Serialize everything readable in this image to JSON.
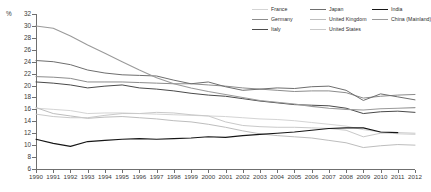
{
  "chart_data": {
    "type": "line",
    "title": "",
    "xlabel": "",
    "ylabel": "%",
    "unit_label": "%",
    "xlim": [
      1990,
      2012
    ],
    "ylim": [
      6,
      32
    ],
    "ytick_step": 2,
    "grid": false,
    "legend_position": "top-right",
    "x": [
      1990,
      1991,
      1992,
      1993,
      1994,
      1995,
      1996,
      1997,
      1998,
      1999,
      2000,
      2001,
      2002,
      2003,
      2004,
      2005,
      2006,
      2007,
      2008,
      2009,
      2010,
      2011,
      2012
    ],
    "yticks": [
      6,
      8,
      10,
      12,
      14,
      16,
      18,
      20,
      22,
      24,
      26,
      28,
      30,
      32
    ],
    "xticks": [
      1990,
      1991,
      1992,
      1993,
      1994,
      1995,
      1996,
      1997,
      1998,
      1999,
      2000,
      2001,
      2002,
      2003,
      2004,
      2005,
      2006,
      2007,
      2008,
      2009,
      2010,
      2011,
      2012
    ],
    "series": [
      {
        "name": "France",
        "color": "#d4d4d4",
        "width": 1.0,
        "values": [
          16.2,
          16.0,
          15.8,
          15.3,
          15.4,
          15.4,
          15.3,
          15.2,
          15.1,
          15.0,
          14.9,
          14.8,
          14.6,
          14.4,
          14.3,
          14.1,
          13.8,
          13.5,
          13.2,
          12.6,
          12.2,
          11.9,
          11.8
        ]
      },
      {
        "name": "Germany",
        "color": "#8c8c8c",
        "width": 1.0,
        "values": [
          21.5,
          21.4,
          21.2,
          20.6,
          20.6,
          20.6,
          20.5,
          20.4,
          20.3,
          20.3,
          20.1,
          19.9,
          19.6,
          19.4,
          19.2,
          19.0,
          19.1,
          19.1,
          18.8,
          17.9,
          18.2,
          18.4,
          18.5
        ]
      },
      {
        "name": "Italy",
        "color": "#4a4a4a",
        "width": 1.0,
        "values": [
          20.6,
          20.4,
          20.1,
          19.6,
          19.9,
          20.1,
          19.6,
          19.4,
          19.1,
          18.7,
          18.4,
          18.2,
          17.8,
          17.4,
          17.1,
          16.8,
          16.7,
          16.6,
          16.2,
          15.3,
          15.6,
          15.7,
          15.5
        ]
      },
      {
        "name": "Japan",
        "color": "#6e6e6e",
        "width": 1.0,
        "values": [
          24.2,
          24.0,
          23.5,
          22.6,
          22.1,
          21.8,
          21.7,
          21.6,
          20.9,
          20.3,
          20.6,
          19.8,
          19.2,
          19.4,
          19.6,
          19.5,
          19.8,
          19.9,
          19.2,
          17.5,
          18.6,
          18.1,
          17.6
        ]
      },
      {
        "name": "United Kingdom",
        "color": "#bdbdbd",
        "width": 1.0,
        "values": [
          16.3,
          15.3,
          14.9,
          14.5,
          14.7,
          14.8,
          14.6,
          14.4,
          14.1,
          13.9,
          13.5,
          13.0,
          12.4,
          11.9,
          11.6,
          11.4,
          11.2,
          10.8,
          10.4,
          9.6,
          9.9,
          10.1,
          10.0
        ]
      },
      {
        "name": "United States",
        "color": "#c9c9c9",
        "width": 1.0,
        "values": [
          15.2,
          14.8,
          14.6,
          14.6,
          15.0,
          15.3,
          15.3,
          15.5,
          15.4,
          15.1,
          14.9,
          13.9,
          13.3,
          13.1,
          13.0,
          13.0,
          12.9,
          12.8,
          12.5,
          11.4,
          12.0,
          12.1,
          12.0
        ]
      },
      {
        "name": "India",
        "color": "#161616",
        "width": 1.1,
        "values": [
          11.0,
          10.3,
          9.8,
          10.6,
          10.8,
          11.0,
          11.1,
          11.0,
          11.1,
          11.2,
          11.4,
          11.3,
          11.6,
          11.8,
          12.0,
          12.2,
          12.5,
          12.8,
          12.9,
          12.9,
          12.2,
          12.1,
          null
        ]
      },
      {
        "name": "China (Mainland)",
        "color": "#9a9a9a",
        "width": 1.1,
        "values": [
          30.0,
          29.6,
          28.3,
          26.8,
          25.4,
          24.0,
          22.6,
          21.3,
          20.3,
          19.6,
          19.0,
          18.5,
          18.0,
          17.5,
          17.2,
          16.9,
          16.5,
          16.2,
          16.0,
          15.9,
          16.1,
          16.2,
          16.3
        ]
      }
    ]
  },
  "legend": {
    "columns": [
      {
        "items": [
          {
            "label": "France",
            "color": "#d4d4d4",
            "width": 1.0
          },
          {
            "label": "Germany",
            "color": "#8c8c8c",
            "width": 1.0
          },
          {
            "label": "Italy",
            "color": "#4a4a4a",
            "width": 1.2
          }
        ]
      },
      {
        "items": [
          {
            "label": "Japan",
            "color": "#6e6e6e",
            "width": 1.0
          },
          {
            "label": "United Kingdom",
            "color": "#bdbdbd",
            "width": 1.0
          },
          {
            "label": "United States",
            "color": "#c9c9c9",
            "width": 1.2
          }
        ]
      },
      {
        "items": [
          {
            "label": "India",
            "color": "#161616",
            "width": 1.4
          },
          {
            "label": "China (Mainland)",
            "color": "#9a9a9a",
            "width": 1.2
          }
        ]
      }
    ]
  },
  "axis": {
    "unit": "%",
    "y_labels": [
      "32",
      "30",
      "28",
      "26",
      "24",
      "22",
      "20",
      "18",
      "16",
      "14",
      "12",
      "10",
      "8",
      "6"
    ],
    "x_labels": [
      "1990",
      "1991",
      "1992",
      "1993",
      "1994",
      "1995",
      "1996",
      "1997",
      "1998",
      "1999",
      "2000",
      "2001",
      "2002",
      "2003",
      "2004",
      "2005",
      "2006",
      "2007",
      "2008",
      "2009",
      "2010",
      "2011",
      "2012"
    ]
  }
}
